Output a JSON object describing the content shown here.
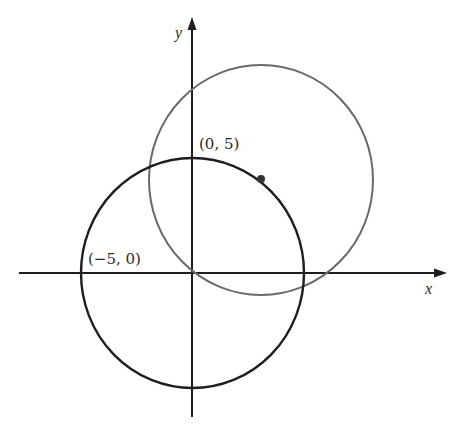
{
  "figure": {
    "axes": {
      "x_label": "x",
      "y_label": "y"
    },
    "points": [
      {
        "label": "(0, 5)",
        "x": 0,
        "y": 5
      },
      {
        "label": "(−5, 0)",
        "x": -5,
        "y": 0
      }
    ],
    "circles": [
      {
        "name": "black-circle",
        "center": [
          0,
          0
        ],
        "radius": 5,
        "color": "#1e1e1e"
      },
      {
        "name": "gray-circle",
        "center": [
          3,
          4
        ],
        "radius": 5,
        "color": "#6a6a6a"
      }
    ],
    "marked_point": {
      "description": "dot on black circle",
      "color": "#333333"
    }
  },
  "labels": {
    "point_0_5": "(0, 5)",
    "point_neg5_0": "(−5, 0)",
    "x": "x",
    "y": "y"
  },
  "colors": {
    "axis": "#1e1e1e",
    "black_circle": "#1e1e1e",
    "gray_circle": "#6a6a6a",
    "text": "#2a2a2a"
  }
}
